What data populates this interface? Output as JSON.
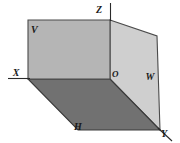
{
  "figure": {
    "type": "descriptive-geometry-projection-planes",
    "width": 180,
    "height": 143,
    "background_color": "#ffffff",
    "planes": [
      {
        "id": "V",
        "label": "V",
        "name": "vertical-frontal-plane",
        "fill_color": "#b5b5b5",
        "stroke_color": "#4a4a4a",
        "label_x": 31,
        "label_y": 33,
        "points": "28,20 110,20 110,79 28,79"
      },
      {
        "id": "H",
        "label": "H",
        "name": "horizontal-plane",
        "fill_color": "#717171",
        "stroke_color": "#3a3a3a",
        "label_x": 78,
        "label_y": 130,
        "points": "28,79 110,79 160,130 78,130"
      },
      {
        "id": "W",
        "label": "W",
        "name": "profile-plane",
        "fill_color": "#cfcfcf",
        "stroke_color": "#4a4a4a",
        "label_x": 150,
        "label_y": 80,
        "points": "110,20 157,36 160,130 110,79"
      }
    ],
    "axes": [
      {
        "id": "X",
        "label": "X",
        "name": "x-axis",
        "x1": 8,
        "y1": 78.5,
        "x2": 30,
        "y2": 78.5,
        "label_x": 16,
        "label_y": 76,
        "color": "#2a2a2a"
      },
      {
        "id": "Z",
        "label": "Z",
        "name": "z-axis",
        "x1": 110.5,
        "y1": 3,
        "x2": 110.5,
        "y2": 21,
        "label_x": 99,
        "label_y": 13,
        "color": "#2a2a2a"
      },
      {
        "id": "Y",
        "label": "Y",
        "name": "y-axis",
        "x1": 158,
        "y1": 128,
        "x2": 172,
        "y2": 141,
        "label_x": 164,
        "label_y": 137,
        "color": "#2a2a2a"
      }
    ],
    "origin": {
      "id": "O",
      "label": "O",
      "name": "origin-point",
      "x": 110,
      "y": 79,
      "label_x": 112,
      "label_y": 77
    }
  }
}
